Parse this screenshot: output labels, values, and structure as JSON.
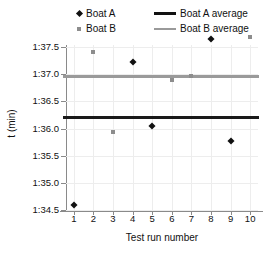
{
  "chart_data": {
    "type": "scatter",
    "title": "",
    "xlabel": "Test run number",
    "ylabel": "t (min)",
    "x": [
      1,
      2,
      3,
      4,
      5,
      6,
      7,
      8,
      9,
      10
    ],
    "xlim": [
      0.6,
      10.4
    ],
    "ylim": [
      1.345,
      1.375
    ],
    "ytick_labels": [
      "1:34.5",
      "1:35.0",
      "1:35.5",
      "1:36.0",
      "1:36.5",
      "1:37.0",
      "1:37.5"
    ],
    "ytick_values": [
      1.345,
      1.35,
      1.355,
      1.36,
      1.365,
      1.37,
      1.375
    ],
    "xtick_labels": [
      "1",
      "2",
      "3",
      "4",
      "5",
      "6",
      "7",
      "8",
      "9",
      "10"
    ],
    "grid": true,
    "legend_position": "top",
    "series": [
      {
        "name": "Boat A",
        "marker": "diamond",
        "color": "#111111",
        "points": [
          {
            "x": 1,
            "y": 1.3459,
            "label": "1:34.59"
          },
          {
            "x": 4,
            "y": 1.3722,
            "label": "1:37.22"
          },
          {
            "x": 5,
            "y": 1.3604,
            "label": "1:36.04"
          },
          {
            "x": 8,
            "y": 1.3765,
            "label": "1:37.65"
          },
          {
            "x": 9,
            "y": 1.3577,
            "label": "1:35.77"
          }
        ]
      },
      {
        "name": "Boat B",
        "marker": "square",
        "color": "#8d8d8d",
        "points": [
          {
            "x": 2,
            "y": 1.3741,
            "label": "1:37.41"
          },
          {
            "x": 3,
            "y": 1.3593,
            "label": "1:35.93"
          },
          {
            "x": 6,
            "y": 1.369,
            "label": "1:36.90"
          },
          {
            "x": 7,
            "y": 1.3697,
            "label": "1:36.97"
          },
          {
            "x": 10,
            "y": 1.3768,
            "label": "1:37.68"
          }
        ]
      }
    ],
    "average_lines": [
      {
        "name": "Boat A average",
        "value": 1.3622,
        "label": "1:36.22",
        "color": "#1a1a1a"
      },
      {
        "name": "Boat B average",
        "value": 1.3697,
        "label": "1:36.97",
        "color": "#9a9a9a"
      }
    ]
  },
  "legend": {
    "entries": [
      {
        "label": "Boat A",
        "kind": "marker-diamond"
      },
      {
        "label": "Boat B",
        "kind": "marker-square"
      },
      {
        "label": "Boat A average",
        "kind": "line-dark"
      },
      {
        "label": "Boat B average",
        "kind": "line-gray"
      }
    ]
  },
  "axes": {
    "x_title": "Test run number",
    "y_title": "t (min)"
  }
}
